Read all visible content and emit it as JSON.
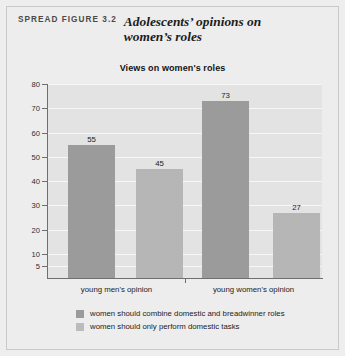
{
  "figure": {
    "kicker": "SPREAD FIGURE 3.2",
    "title": "Adolescents’ opinions on women’s roles"
  },
  "chart_data": {
    "type": "bar",
    "title": "Views on women's roles",
    "xlabel": "",
    "ylabel": "% of response",
    "categories": [
      "young men's opinion",
      "young women's opinion"
    ],
    "series": [
      {
        "name": "women should combine domestic and breadwinner roles",
        "color": "#9b9b9b",
        "values": [
          55,
          73
        ]
      },
      {
        "name": "women should only perform domestic tasks",
        "color": "#b6b6b6",
        "values": [
          45,
          27
        ]
      }
    ],
    "ylim": [
      0,
      80
    ],
    "yticks": [
      80,
      70,
      60,
      50,
      40,
      30,
      20,
      10,
      5
    ],
    "grid": true,
    "legend_position": "bottom",
    "data_labels": [
      "55",
      "45",
      "73",
      "27"
    ]
  }
}
